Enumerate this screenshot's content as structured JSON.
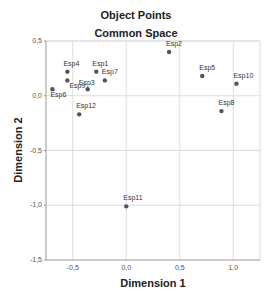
{
  "chart_data": {
    "type": "scatter",
    "title": "Object Points",
    "subtitle": "Common Space",
    "xlabel": "Dimension 1",
    "ylabel": "Dimension 2",
    "xlim": [
      -0.75,
      1.25
    ],
    "ylim": [
      -1.5,
      0.5
    ],
    "xticks": [
      "-0,5",
      "0,0",
      "0,5",
      "1,0"
    ],
    "yticks": [
      "0,5",
      "0,0",
      "-0,5",
      "-1,0",
      "-1,5"
    ],
    "grid": true,
    "legend": "none",
    "points": [
      {
        "label": "Esp1",
        "x": -0.28,
        "y": 0.22
      },
      {
        "label": "Esp2",
        "x": 0.4,
        "y": 0.4
      },
      {
        "label": "Esp3",
        "x": -0.36,
        "y": 0.06
      },
      {
        "label": "Esp4",
        "x": -0.55,
        "y": 0.22
      },
      {
        "label": "Esp5",
        "x": 0.71,
        "y": 0.18
      },
      {
        "label": "Esp6",
        "x": -0.69,
        "y": 0.06
      },
      {
        "label": "Esp7",
        "x": -0.2,
        "y": 0.14
      },
      {
        "label": "Esp8",
        "x": 0.89,
        "y": -0.14
      },
      {
        "label": "Esp9",
        "x": -0.55,
        "y": 0.14
      },
      {
        "label": "Esp10",
        "x": 1.03,
        "y": 0.11
      },
      {
        "label": "Esp11",
        "x": 0.0,
        "y": -1.01
      },
      {
        "label": "Esp12",
        "x": -0.44,
        "y": -0.17
      }
    ],
    "colors": {
      "point": "#555555",
      "grid": "#dddddd",
      "axis": "#999999"
    }
  }
}
